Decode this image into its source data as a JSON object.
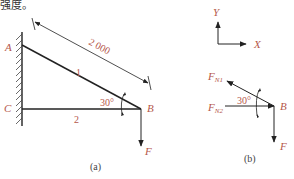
{
  "header_fragment": "强度。",
  "figure_a": {
    "caption": "(a)",
    "points": {
      "A": "A",
      "B": "B",
      "C": "C"
    },
    "member_1": "1",
    "member_2": "2",
    "dimension": "2 000",
    "angle": "30°",
    "force": "F"
  },
  "figure_b": {
    "caption": "(b)",
    "axis_x": "X",
    "axis_y": "Y",
    "point": "B",
    "force_n1": "F",
    "force_n1_sub": "N1",
    "force_n2": "F",
    "force_n2_sub": "N2",
    "angle": "30°",
    "force": "F"
  },
  "colors": {
    "label": "#b5574a",
    "line": "#222222"
  }
}
